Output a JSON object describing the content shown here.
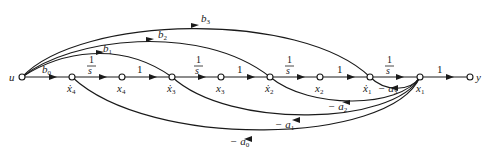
{
  "diagram": {
    "type": "signal-flow-graph",
    "nodes": [
      {
        "id": "u",
        "label": "u"
      },
      {
        "id": "x4dot",
        "label": "ẋ",
        "sub": "4"
      },
      {
        "id": "x4",
        "label": "x",
        "sub": "4"
      },
      {
        "id": "x3dot",
        "label": "ẋ",
        "sub": "3"
      },
      {
        "id": "x3",
        "label": "x",
        "sub": "3"
      },
      {
        "id": "x2dot",
        "label": "ẋ",
        "sub": "2"
      },
      {
        "id": "x2",
        "label": "x",
        "sub": "2"
      },
      {
        "id": "x1dot",
        "label": "ẋ",
        "sub": "1"
      },
      {
        "id": "x1",
        "label": "x",
        "sub": "1"
      },
      {
        "id": "y",
        "label": "y"
      }
    ],
    "forward_gains": {
      "b0": {
        "sym": "b",
        "sub": "0"
      },
      "int4": {
        "num": "1",
        "den": "s"
      },
      "one4": "1",
      "int3": {
        "num": "1",
        "den": "s"
      },
      "one3": "1",
      "int2": {
        "num": "1",
        "den": "s"
      },
      "one2": "1",
      "int1": {
        "num": "1",
        "den": "s"
      },
      "out": "1"
    },
    "feedforward_gains": {
      "b1": {
        "sym": "b",
        "sub": "1"
      },
      "b2": {
        "sym": "b",
        "sub": "2"
      },
      "b3": {
        "sym": "b",
        "sub": "3"
      }
    },
    "feedback_gains": {
      "a3": {
        "sym": "− a",
        "sub": "3"
      },
      "a2": {
        "sym": "− a",
        "sub": "2"
      },
      "a1": {
        "sym": "− a",
        "sub": "1"
      },
      "a0": {
        "sym": "− a",
        "sub": "0"
      }
    },
    "edges": [
      {
        "from": "u",
        "to": "x4dot",
        "gain": "b0"
      },
      {
        "from": "x4dot",
        "to": "x4",
        "gain": "1/s"
      },
      {
        "from": "x4",
        "to": "x3dot",
        "gain": "1"
      },
      {
        "from": "x3dot",
        "to": "x3",
        "gain": "1/s"
      },
      {
        "from": "x3",
        "to": "x2dot",
        "gain": "1"
      },
      {
        "from": "x2dot",
        "to": "x2",
        "gain": "1/s"
      },
      {
        "from": "x2",
        "to": "x1dot",
        "gain": "1"
      },
      {
        "from": "x1dot",
        "to": "x1",
        "gain": "1/s"
      },
      {
        "from": "x1",
        "to": "y",
        "gain": "1"
      },
      {
        "from": "u",
        "to": "x3dot",
        "gain": "b1"
      },
      {
        "from": "u",
        "to": "x2dot",
        "gain": "b2"
      },
      {
        "from": "u",
        "to": "x1dot",
        "gain": "b3"
      },
      {
        "from": "x1",
        "to": "x1dot",
        "gain": "-a3"
      },
      {
        "from": "x1",
        "to": "x2dot",
        "gain": "-a2"
      },
      {
        "from": "x1",
        "to": "x3dot",
        "gain": "-a1"
      },
      {
        "from": "x1",
        "to": "x4dot",
        "gain": "-a0"
      }
    ]
  }
}
